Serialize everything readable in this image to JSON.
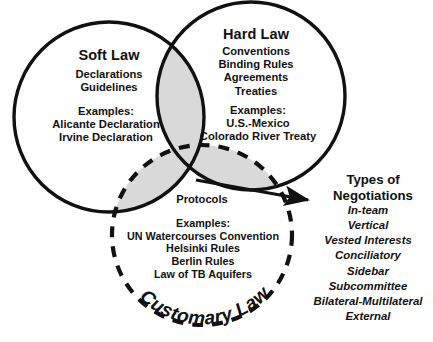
{
  "diagram": {
    "type": "venn-3-circle",
    "title_visible": false,
    "background": "#ffffff",
    "stroke_color": "#111111",
    "overlap_fill": "#d9d9d9"
  },
  "circles": {
    "soft": {
      "name": "Soft Law",
      "stroke_style": "solid",
      "title": "Soft Law",
      "terms": [
        "Declarations",
        "Guidelines"
      ],
      "examples_label": "Examples:",
      "examples": [
        "Alicante Declaration",
        "Irvine Declaration"
      ]
    },
    "hard": {
      "name": "Hard Law",
      "stroke_style": "solid",
      "title": "Hard Law",
      "terms": [
        "Conventions",
        "Binding Rules",
        "Agreements",
        "Treaties"
      ],
      "examples_label": "Examples:",
      "examples": [
        "U.S.-Mexico",
        "Colorado River Treaty"
      ]
    },
    "customary": {
      "name": "Customary Law",
      "stroke_style": "dashed",
      "title": "Customary Law",
      "terms": [
        "Protocols"
      ],
      "examples_label": "Examples:",
      "examples": [
        "UN Watercourses Convention",
        "Helsinki Rules",
        "Berlin Rules",
        "Law of TB Aquifers"
      ]
    }
  },
  "callout": {
    "arrow": "arrow-pointing-right",
    "heading_line1": "Types of",
    "heading_line2": "Negotiations",
    "items": [
      "In-team",
      "Vertical",
      "Vested Interests",
      "Conciliatory",
      "Sidebar",
      "Subcommittee",
      "Bilateral-Multilateral",
      "External"
    ]
  }
}
